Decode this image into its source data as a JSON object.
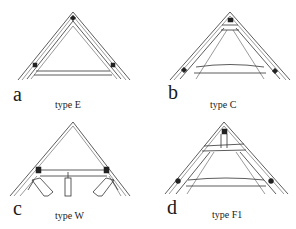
{
  "figure": {
    "panels": [
      {
        "id": "a",
        "letter": "a",
        "caption": "type E",
        "truss_type": "E"
      },
      {
        "id": "b",
        "letter": "b",
        "caption": "type C",
        "truss_type": "C"
      },
      {
        "id": "c",
        "letter": "c",
        "caption": "type W",
        "truss_type": "W"
      },
      {
        "id": "d",
        "letter": "d",
        "caption": "type F1",
        "truss_type": "F1"
      }
    ]
  }
}
